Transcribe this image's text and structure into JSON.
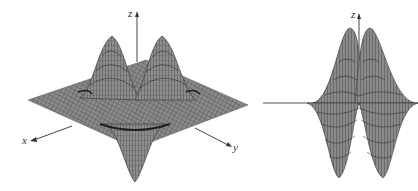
{
  "figures": [
    {
      "id": "left",
      "view": "perspective 3D surface",
      "axes": {
        "x": "x",
        "y": "y",
        "z": "z"
      },
      "features": [
        "two positive peaks",
        "two negative troughs",
        "flat plane at z=0"
      ]
    },
    {
      "id": "right",
      "view": "side view (looking along an axis)",
      "axes": {
        "z": "z"
      },
      "features": [
        "two positive peaks",
        "two negative troughs"
      ]
    }
  ],
  "colors": {
    "surface": "#8a8a8a",
    "surface_dark": "#555555",
    "mesh": "#2b2b2b",
    "axis": "#444444",
    "background": "#ffffff"
  }
}
